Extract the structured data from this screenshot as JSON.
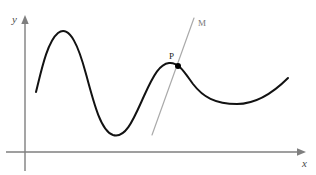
{
  "figure": {
    "kind": "function-graph-with-tangent-line",
    "background_color": "#ffffff",
    "width": 316,
    "height": 175,
    "axes": {
      "color": "#7f7f7f",
      "stroke_width": 1.4,
      "origin": {
        "x": 25,
        "y": 152
      },
      "x_axis": {
        "label": "x",
        "label_color": "#4a4a4a",
        "from": {
          "x": 6,
          "y": 152
        },
        "to": {
          "x": 306,
          "y": 152
        },
        "arrow": "right"
      },
      "y_axis": {
        "label": "y",
        "label_color": "#4a4a4a",
        "from": {
          "x": 25,
          "y": 171
        },
        "to": {
          "x": 25,
          "y": 15
        },
        "arrow": "up"
      }
    },
    "curve": {
      "name": "function-curve",
      "color": "#121212",
      "stroke_width": 2.0,
      "start": {
        "x": 36,
        "y": 92
      },
      "end": {
        "x": 288,
        "y": 78
      },
      "extrema": [
        {
          "type": "local-maximum",
          "x": 58,
          "y": 33
        },
        {
          "type": "local-minimum",
          "x": 113,
          "y": 135
        },
        {
          "type": "local-maximum",
          "x": 169,
          "y": 63
        },
        {
          "type": "local-minimum",
          "x": 237,
          "y": 104
        }
      ],
      "path": "M 36,92 C 41,72 47,42 58,33 C 70,24 79,48 86,74 C 94,104 101,131 113,135 C 126,139 134,118 144,96 C 154,74 160,64 169,63 C 179,62 185,73 193,84 C 203,97 215,104 237,104 C 258,104 275,91 288,78"
    },
    "tangent_line": {
      "name": "tangent-line-M",
      "label": "M",
      "label_color": "#777777",
      "color": "#aaaaaa",
      "stroke_width": 1.2,
      "from": {
        "x": 152,
        "y": 135
      },
      "to": {
        "x": 194,
        "y": 18
      }
    },
    "point": {
      "name": "point-P",
      "label": "P",
      "label_color": "#1a1a1a",
      "color": "#000000",
      "radius": 3.0,
      "x": 178,
      "y": 66
    }
  }
}
